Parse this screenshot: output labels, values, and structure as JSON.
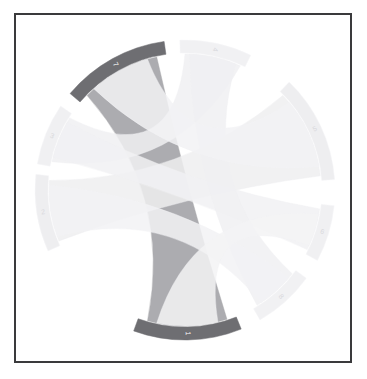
{
  "figure": {
    "type": "chord-diagram",
    "title": "",
    "background_color": "#ffffff",
    "frame_color": "#3a3a3c",
    "frame_width_px": 2
  },
  "chart_data": {
    "type": "chord",
    "title": "",
    "subtitle": "",
    "xlabel": "",
    "ylabel": "",
    "legend_position": "none",
    "grid": false,
    "highlight_color": "#6e6e72",
    "highlight_ribbon_color": "#a8a8ac",
    "faint_color": "#f0f0f2",
    "faint_ribbon_color": "#f4f4f6",
    "center_x": 169,
    "center_y": 175,
    "outer_radius": 150,
    "arc_thickness": 13,
    "groups": [
      {
        "id": "g0",
        "label": "1",
        "label_color": "#ffffff",
        "start_angle": 158,
        "end_angle": 200,
        "highlighted": true,
        "arc_color": "#6e6e72"
      },
      {
        "id": "g1",
        "label": "7",
        "label_color": "#ffffff",
        "start_angle": 310,
        "end_angle": 352,
        "highlighted": true,
        "arc_color": "#6e6e72"
      },
      {
        "id": "g2",
        "label": "2",
        "label_color": "#d8d8dc",
        "start_angle": 246,
        "end_angle": 276,
        "highlighted": false,
        "arc_color": "#eeeef0"
      },
      {
        "id": "g3",
        "label": "3",
        "label_color": "#d8d8dc",
        "start_angle": 280,
        "end_angle": 304,
        "highlighted": false,
        "arc_color": "#f0f0f2"
      },
      {
        "id": "g4",
        "label": "4",
        "label_color": "#d8d8dc",
        "start_angle": 358,
        "end_angle": 26,
        "highlighted": false,
        "arc_color": "#f1f1f3"
      },
      {
        "id": "g5",
        "label": "5",
        "label_color": "#d8d8dc",
        "start_angle": 44,
        "end_angle": 86,
        "highlighted": false,
        "arc_color": "#eeeef0"
      },
      {
        "id": "g6",
        "label": "6",
        "label_color": "#d8d8dc",
        "start_angle": 96,
        "end_angle": 118,
        "highlighted": false,
        "arc_color": "#f0f0f2"
      },
      {
        "id": "g7",
        "label": "8",
        "label_color": "#d8d8dc",
        "start_angle": 126,
        "end_angle": 150,
        "highlighted": false,
        "arc_color": "#f1f1f3"
      }
    ],
    "ribbons": [
      {
        "source": "g0",
        "target": "g1",
        "s_from": 162,
        "s_to": 196,
        "t_from": 314,
        "t_to": 348,
        "color": "#a8a8ac",
        "highlighted": true
      },
      {
        "source": "g5",
        "target": "g2",
        "s_from": 46,
        "s_to": 84,
        "t_from": 248,
        "t_to": 274,
        "color": "#eeeef0",
        "highlighted": false
      },
      {
        "source": "g4",
        "target": "g3",
        "s_from": 0,
        "s_to": 24,
        "t_from": 282,
        "t_to": 302,
        "color": "#f0f0f2",
        "highlighted": false
      },
      {
        "source": "g6",
        "target": "g3",
        "s_from": 98,
        "s_to": 116,
        "t_from": 284,
        "t_to": 300,
        "color": "#f1f1f3",
        "highlighted": false
      },
      {
        "source": "g7",
        "target": "g4",
        "s_from": 128,
        "s_to": 148,
        "t_from": 2,
        "t_to": 22,
        "color": "#f0f0f2",
        "highlighted": false
      },
      {
        "source": "g5",
        "target": "g1",
        "s_from": 50,
        "s_to": 80,
        "t_from": 318,
        "t_to": 344,
        "color": "#f2f2f4",
        "highlighted": false
      },
      {
        "source": "g7",
        "target": "g2",
        "s_from": 130,
        "s_to": 146,
        "t_from": 250,
        "t_to": 272,
        "color": "#f2f2f4",
        "highlighted": false
      },
      {
        "source": "g6",
        "target": "g0",
        "s_from": 100,
        "s_to": 114,
        "t_from": 166,
        "t_to": 192,
        "color": "#f3f3f5",
        "highlighted": false
      }
    ]
  }
}
